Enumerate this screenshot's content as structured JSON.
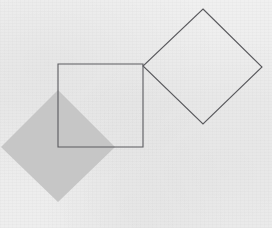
{
  "figure": {
    "width": 272,
    "height": 228,
    "background_color": "#f6f6f6"
  },
  "colors": {
    "paper": "#f6f6f6",
    "stroke": "#5a5a5e",
    "gray_fill": "#c6c6c6",
    "gray_fill_edge": "#c2c2c2",
    "white_fill": "none"
  },
  "shapes": [
    {
      "id": "gray-diamond",
      "name": "filled-gray-diamond",
      "type": "polygon",
      "fill": "#c6c6c6",
      "stroke": "none",
      "stroke_width": 0,
      "points": "58,90 115,147 58,202 1,147",
      "vertices": {
        "top": [
          58,
          90
        ],
        "right": [
          115,
          147
        ],
        "bottom": [
          58,
          202
        ],
        "left": [
          1,
          147
        ]
      },
      "rotation_deg": 45,
      "side_length": 80,
      "clipped_at_left_edge": true
    },
    {
      "id": "outline-square",
      "name": "outlined-square",
      "type": "polygon",
      "fill": "none",
      "stroke": "#5a5a5e",
      "stroke_width": 1.1,
      "points": "58,64 143,64 143,147 58,147",
      "vertices": {
        "top_left": [
          58,
          64
        ],
        "top_right": [
          143,
          64
        ],
        "bottom_right": [
          143,
          147
        ],
        "bottom_left": [
          58,
          147
        ]
      },
      "rotation_deg": 0,
      "width": 85,
      "height": 83
    },
    {
      "id": "outline-diamond",
      "name": "outlined-diamond",
      "type": "polygon",
      "fill": "none",
      "stroke": "#5a5a5e",
      "stroke_width": 1.1,
      "points": "203,9 262,67 203,124 143,66",
      "vertices": {
        "top": [
          203,
          9
        ],
        "right": [
          262,
          67
        ],
        "bottom": [
          203,
          124
        ],
        "left": [
          143,
          66
        ]
      },
      "rotation_deg": 45,
      "side_length": 83
    }
  ],
  "labels": [],
  "annotations": []
}
